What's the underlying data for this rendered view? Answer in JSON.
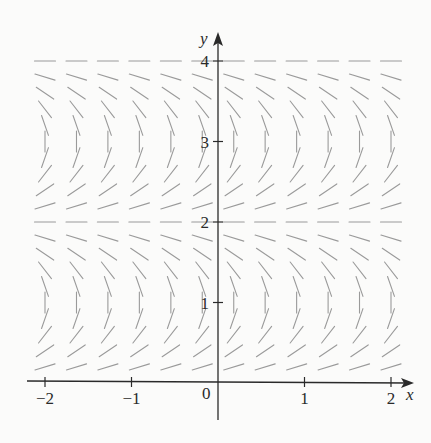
{
  "chart_data": {
    "type": "slope-field",
    "title": "",
    "equation_estimate": "dy/dx = tan(pi*y/2)",
    "xlabel": "x",
    "ylabel": "y",
    "xlim": [
      -2,
      2
    ],
    "ylim": [
      0,
      4
    ],
    "x_ticks": [
      {
        "value": -2,
        "label": "−2"
      },
      {
        "value": -1,
        "label": "−1"
      },
      {
        "value": 1,
        "label": "1"
      },
      {
        "value": 2,
        "label": "2"
      }
    ],
    "y_ticks": [
      {
        "value": 1,
        "label": "1"
      },
      {
        "value": 2,
        "label": "2"
      },
      {
        "value": 3,
        "label": "3"
      },
      {
        "value": 4,
        "label": "4"
      }
    ],
    "origin_label": "0",
    "grid": false,
    "legend": null,
    "columns_x": [
      -2,
      -1.636,
      -1.273,
      -0.909,
      -0.545,
      -0.182,
      0.182,
      0.545,
      0.909,
      1.273,
      1.636,
      2
    ],
    "rows": [
      {
        "y": 0.2,
        "slope": 0.325
      },
      {
        "y": 0.4,
        "slope": 0.727
      },
      {
        "y": 0.6,
        "slope": 1.376
      },
      {
        "y": 0.8,
        "slope": 3.078
      },
      {
        "y": 1.0,
        "slope": "vertical"
      },
      {
        "y": 1.2,
        "slope": -3.078
      },
      {
        "y": 1.4,
        "slope": -1.376
      },
      {
        "y": 1.6,
        "slope": -0.727
      },
      {
        "y": 1.8,
        "slope": -0.325
      },
      {
        "y": 2.0,
        "slope": 0
      },
      {
        "y": 2.2,
        "slope": 0.325
      },
      {
        "y": 2.4,
        "slope": 0.727
      },
      {
        "y": 2.6,
        "slope": 1.376
      },
      {
        "y": 2.8,
        "slope": 3.078
      },
      {
        "y": 3.0,
        "slope": "vertical"
      },
      {
        "y": 3.2,
        "slope": -3.078
      },
      {
        "y": 3.4,
        "slope": -1.376
      },
      {
        "y": 3.6,
        "slope": -0.727
      },
      {
        "y": 3.8,
        "slope": -0.325
      },
      {
        "y": 4.0,
        "slope": 0
      }
    ],
    "colors": {
      "marks": "#9a9a9a",
      "axes": "#2a2a2a",
      "background": "#fbfbfa"
    }
  }
}
